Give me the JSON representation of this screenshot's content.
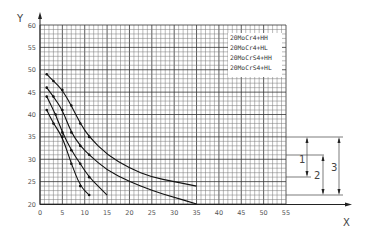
{
  "chart_data": {
    "type": "line",
    "title": "",
    "xlabel": "X",
    "ylabel": "Y",
    "xlim": [
      0,
      55
    ],
    "ylim": [
      20,
      60
    ],
    "x_ticks": [
      "0",
      "5",
      "10",
      "15",
      "20",
      "25",
      "30",
      "35",
      "40",
      "45",
      "50",
      "55"
    ],
    "y_ticks": [
      "20",
      "25",
      "30",
      "35",
      "40",
      "45",
      "50",
      "55",
      "60"
    ],
    "grid": true,
    "legend_position": "upper-right-inside",
    "series": [
      {
        "name": "20MoCr4+HH",
        "points": [
          [
            1.5,
            49
          ],
          [
            3,
            47.5
          ],
          [
            5,
            45.5
          ],
          [
            7,
            42
          ],
          [
            9,
            38
          ],
          [
            11,
            35
          ],
          [
            15,
            31
          ],
          [
            20,
            28
          ],
          [
            25,
            26
          ],
          [
            30,
            25
          ],
          [
            35,
            24
          ]
        ]
      },
      {
        "name": "20MoCr4+HL",
        "points": [
          [
            1.5,
            46
          ],
          [
            3,
            44
          ],
          [
            5,
            41
          ],
          [
            7,
            36
          ],
          [
            9,
            33
          ],
          [
            11,
            31
          ],
          [
            15,
            27.5
          ],
          [
            20,
            25
          ],
          [
            25,
            23
          ],
          [
            30,
            21.5
          ],
          [
            35,
            20
          ]
        ]
      },
      {
        "name": "20MoCrS4+HH",
        "points": [
          [
            1.5,
            44
          ],
          [
            3.5,
            40
          ],
          [
            5,
            36
          ],
          [
            7,
            32
          ],
          [
            9,
            29
          ],
          [
            11,
            26
          ],
          [
            13,
            24
          ],
          [
            15,
            22
          ]
        ]
      },
      {
        "name": "20MoCrS4+HL",
        "points": [
          [
            1.5,
            41
          ],
          [
            3,
            38
          ],
          [
            5,
            35
          ],
          [
            7,
            29
          ],
          [
            9,
            24
          ],
          [
            11,
            22
          ]
        ]
      }
    ],
    "annotations": [
      {
        "label": "1",
        "type": "dimension",
        "from_y": 35,
        "to_y": 27
      },
      {
        "label": "2",
        "type": "dimension",
        "from_y": 32,
        "to_y": 24
      },
      {
        "label": "3",
        "type": "dimension",
        "from_y": 35,
        "to_y": 24
      }
    ]
  },
  "axes": {
    "x_label": "X",
    "y_label": "Y"
  },
  "legend": [
    "20MoCr4+HH",
    "20MoCr4+HL",
    "20MoCrS4+HH",
    "20MoCrS4+HL"
  ],
  "dimensions": {
    "d1": "1",
    "d2": "2",
    "d3": "3"
  }
}
